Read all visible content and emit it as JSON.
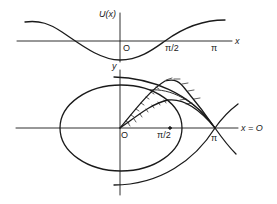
{
  "figure": {
    "top_panel": {
      "ylabel": "U(x)",
      "xlabel": "x",
      "origin_label": "O",
      "tick_half_pi": "π/2",
      "tick_pi": "π"
    },
    "bottom_panel": {
      "ylabel": "y",
      "origin_label": "O",
      "tick_half_pi": "π/2",
      "tick_pi": "π",
      "axis_annotation": "x = O"
    },
    "colors": {
      "ink": "#1a1a1a",
      "background": "#ffffff"
    }
  }
}
